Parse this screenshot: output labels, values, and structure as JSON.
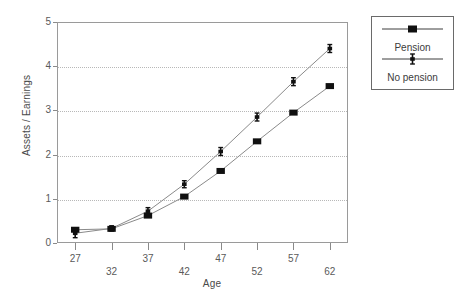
{
  "chart_data": {
    "type": "line",
    "title": "",
    "xlabel": "Age",
    "ylabel": "Assets / Earnings",
    "x": [
      27,
      32,
      37,
      42,
      47,
      52,
      57,
      62
    ],
    "xticklabels": [
      "27",
      "32",
      "37",
      "42",
      "47",
      "52",
      "57",
      "62"
    ],
    "yticklabels": [
      "0",
      "1",
      "2",
      "3",
      "4",
      "5"
    ],
    "yticks": [
      0,
      1,
      2,
      3,
      4,
      5
    ],
    "xlim": [
      24.5,
      64.5
    ],
    "ylim": [
      0,
      5
    ],
    "grid": "horizontal-dotted",
    "legend_position": "outside-top-right",
    "series": [
      {
        "name": "Pension",
        "marker": "filled-square",
        "values": [
          0.3,
          0.32,
          0.62,
          1.05,
          1.63,
          2.3,
          2.95,
          3.55
        ]
      },
      {
        "name": "No pension",
        "marker": "error-bar-cross",
        "values": [
          0.22,
          0.33,
          0.72,
          1.33,
          2.07,
          2.85,
          3.65,
          4.4
        ],
        "error_low": [
          0.12,
          0.27,
          0.64,
          1.25,
          1.98,
          2.76,
          3.56,
          4.31
        ],
        "error_high": [
          0.32,
          0.39,
          0.8,
          1.41,
          2.16,
          2.94,
          3.74,
          4.49
        ]
      }
    ]
  },
  "legend": {
    "entries": [
      {
        "label": "Pension",
        "marker": "filled-square"
      },
      {
        "label": "No pension",
        "marker": "error-bar-cross"
      }
    ]
  },
  "colors": {
    "line": "#8a8a8a",
    "marker": "#101010",
    "axis": "#9a9a9a",
    "grid": "#b8b8b8",
    "text": "#4a4a4a",
    "background": "#ffffff"
  }
}
